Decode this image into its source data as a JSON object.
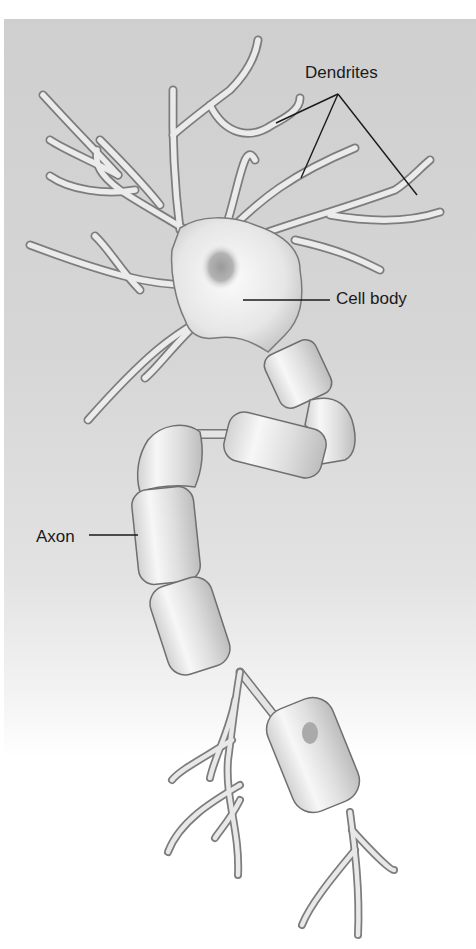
{
  "figure": {
    "labels": {
      "dendrites": "Dendrites",
      "cell_body": "Cell body",
      "axon": "Axon"
    }
  },
  "colors": {
    "background_panel": "#d3d3d3",
    "cell_fill": "#ececec",
    "outline": "#7a7a7a",
    "leader_line": "#1a1a1a",
    "nucleus": "#a8a8a8"
  }
}
